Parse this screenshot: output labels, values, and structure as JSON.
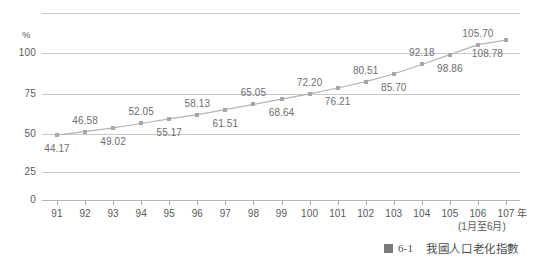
{
  "chart_data": {
    "type": "line",
    "title": "",
    "xlabel": "年",
    "ylabel": "%",
    "x_note": "(1月至6月)",
    "categories": [
      "91",
      "92",
      "93",
      "94",
      "95",
      "96",
      "97",
      "98",
      "99",
      "100",
      "101",
      "102",
      "103",
      "104",
      "105",
      "106",
      "107"
    ],
    "values": [
      44.17,
      46.58,
      49.02,
      52.05,
      55.17,
      58.13,
      61.51,
      65.05,
      68.64,
      72.2,
      76.21,
      80.51,
      85.7,
      92.18,
      98.86,
      105.7,
      108.78
    ],
    "value_labels": [
      "44.17",
      "46.58",
      "49.02",
      "52.05",
      "55.17",
      "58.13",
      "61.51",
      "65.05",
      "68.64",
      "72.20",
      "76.21",
      "80.51",
      "85.70",
      "92.18",
      "98.86",
      "105.70",
      "108.78"
    ],
    "label_positions": [
      "below",
      "above",
      "below",
      "above",
      "below",
      "above",
      "below",
      "above",
      "below",
      "above",
      "below",
      "above",
      "below",
      "above",
      "below",
      "above",
      "below"
    ],
    "ylim": [
      0,
      115
    ],
    "yticks": [
      0,
      25,
      50,
      75,
      100
    ],
    "ytick_labels": [
      "0",
      "25",
      "50",
      "75",
      "100"
    ],
    "grid": true,
    "legend": "none",
    "series_color": "#b3b3b3",
    "marker_color": "#a6a6a6",
    "grid_color": "#c9c9c9",
    "text_color": "#58595b"
  },
  "caption": {
    "mark": "figure-square-mark",
    "number": "6-1",
    "text": "我國人口老化指數"
  }
}
